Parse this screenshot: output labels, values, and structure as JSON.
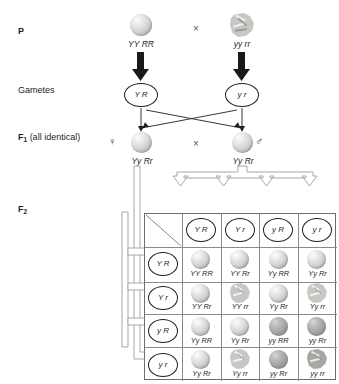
{
  "diagram": {
    "accent": "#231f20",
    "grid_border": "#6e6e6e",
    "grid_line": "#8a8a8a"
  },
  "row_labels": {
    "p": "P",
    "gametes": "Gametes",
    "f1_bold": "F",
    "f1_sub": "1",
    "f1_rest": " (all identical)",
    "f2_bold": "F",
    "f2_sub": "2"
  },
  "p_generation": {
    "left_genotype": "YY RR",
    "right_genotype": "yy rr",
    "cross_symbol": "×",
    "left_seed": "round-light",
    "right_seed": "wrinkled"
  },
  "gametes": {
    "left": "Y R",
    "right": "y r"
  },
  "f1_generation": {
    "left_genotype": "Yy Rr",
    "right_genotype": "Yy Rr",
    "cross_symbol": "×",
    "female_symbol": "♀",
    "male_symbol": "♂",
    "left_seed": "round-light",
    "right_seed": "round-light"
  },
  "punnett": {
    "column_headers": [
      "Y R",
      "Y r",
      "y R",
      "y r"
    ],
    "row_headers": [
      "Y R",
      "Y r",
      "y R",
      "y r"
    ],
    "cells": [
      [
        {
          "genotype": "YY RR",
          "seed": "round-light"
        },
        {
          "genotype": "YY Rr",
          "seed": "round-light"
        },
        {
          "genotype": "Yy RR",
          "seed": "round-light"
        },
        {
          "genotype": "Yy Rr",
          "seed": "round-light"
        }
      ],
      [
        {
          "genotype": "YY Rr",
          "seed": "round-light"
        },
        {
          "genotype": "YY rr",
          "seed": "wrinkled-light"
        },
        {
          "genotype": "Yy Rr",
          "seed": "round-light"
        },
        {
          "genotype": "Yy rr",
          "seed": "wrinkled-light"
        }
      ],
      [
        {
          "genotype": "Yy RR",
          "seed": "round-light"
        },
        {
          "genotype": "Yy Rr",
          "seed": "round-light"
        },
        {
          "genotype": "yy RR",
          "seed": "round-dark"
        },
        {
          "genotype": "yy Rr",
          "seed": "round-dark"
        }
      ],
      [
        {
          "genotype": "Yy Rr",
          "seed": "round-light"
        },
        {
          "genotype": "Yy rr",
          "seed": "wrinkled-light"
        },
        {
          "genotype": "yy Rr",
          "seed": "round-dark"
        },
        {
          "genotype": "yy rr",
          "seed": "wrinkled-dark"
        }
      ]
    ]
  }
}
